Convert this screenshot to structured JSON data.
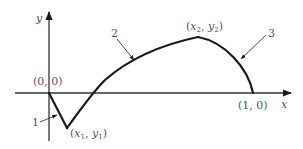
{
  "diagram": {
    "type": "function-curve-sketch",
    "axes": {
      "x_label": "x",
      "y_label": "y"
    },
    "points": {
      "origin": {
        "label": "(0, 0)"
      },
      "minimum": {
        "label_open": "(",
        "x": "x",
        "x_sub": "1",
        "sep": ", ",
        "y": "y",
        "y_sub": "1",
        "label_close": ")"
      },
      "maximum": {
        "label_open": "(",
        "x": "x",
        "x_sub": "2",
        "sep": ", ",
        "y": "y",
        "y_sub": "2",
        "label_close": ")"
      },
      "end": {
        "label": "(1, 0)"
      }
    },
    "segments": [
      {
        "id": "1",
        "label": "1",
        "description": "straight segment from origin down to minimum (x1, y1)"
      },
      {
        "id": "2",
        "label": "2",
        "description": "curve from minimum up through x-axis to maximum (x2, y2)"
      },
      {
        "id": "3",
        "label": "3",
        "description": "curve from maximum down to (1, 0)"
      }
    ],
    "colors": {
      "curve": "#1a1a1a",
      "axis": "#333333",
      "text": "#555555",
      "background": "#ffffff"
    }
  }
}
